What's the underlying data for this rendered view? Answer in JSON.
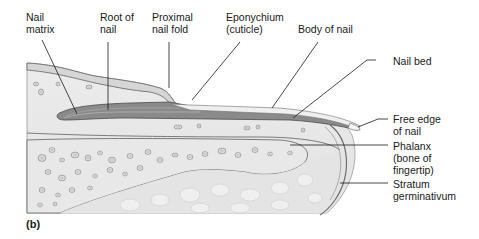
{
  "figure": {
    "panel_label": "(b)",
    "labels": {
      "nail_matrix": "Nail\nmatrix",
      "root_of_nail": "Root of\nnail",
      "proximal_nail_fold": "Proximal\nnail fold",
      "eponychium": "Eponychium\n(cuticle)",
      "body_of_nail": "Body of nail",
      "nail_bed": "Nail bed",
      "free_edge": "Free edge\nof nail",
      "phalanx": "Phalanx\n(bone of\nfingertip)",
      "stratum_germinativum": "Stratum\ngerminativum"
    },
    "colors": {
      "tissue": "#e6e6e6",
      "tissue_light": "#f0f0f0",
      "nail": "#8a8a8a",
      "nail_dark": "#5a5a5a",
      "outline": "#6e6e6e",
      "leader": "#1a1a1a",
      "bone": "#dcdcdc",
      "text": "#1a1a1a"
    }
  }
}
